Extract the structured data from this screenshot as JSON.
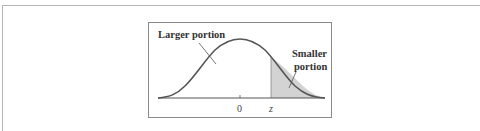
{
  "figure": {
    "left_label": "Larger portion",
    "right_label_line1": "Smaller",
    "right_label_line2": "portion",
    "tick_center": "0",
    "tick_z": "z",
    "colors": {
      "curve": "#555555",
      "shade": "#d3d3d3",
      "border": "#8a8a8a",
      "text": "#333333"
    }
  }
}
